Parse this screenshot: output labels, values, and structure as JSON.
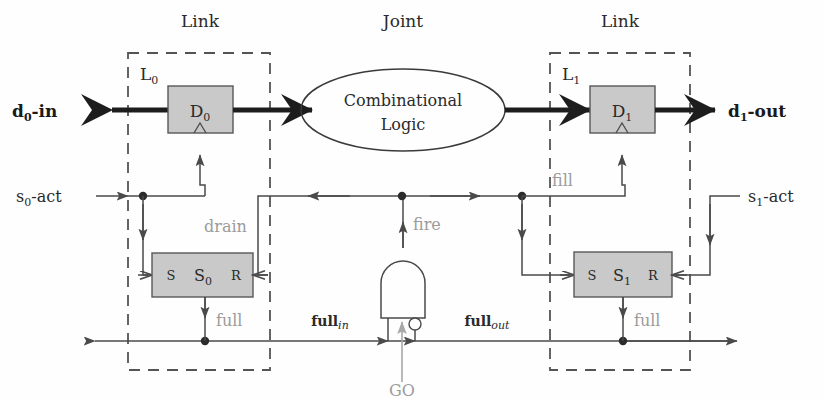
{
  "figure": {
    "type": "block-diagram"
  },
  "sections": {
    "link_left": "Link",
    "joint": "Joint",
    "link_right": "Link"
  },
  "link_left": {
    "name": "L",
    "name_sub": "0",
    "data_register": {
      "label": "D",
      "sub": "0"
    },
    "state_register": {
      "label": "S",
      "sub": "0",
      "set_pin": "S",
      "reset_pin": "R"
    },
    "full_label": "full"
  },
  "link_right": {
    "name": "L",
    "name_sub": "1",
    "data_register": {
      "label": "D",
      "sub": "1"
    },
    "state_register": {
      "label": "S",
      "sub": "1",
      "set_pin": "S",
      "reset_pin": "R"
    },
    "full_label": "full"
  },
  "joint": {
    "combinational_logic_line1": "Combinational",
    "combinational_logic_line2": "Logic",
    "gate_type": "and-gate-with-inverted-input",
    "output_label": "fire",
    "input_left_label": "full",
    "input_left_sub": "in",
    "input_right_label": "full",
    "input_right_sub": "out",
    "input_mid_label": "GO"
  },
  "signals": {
    "data_in": "d",
    "data_in_sub": "0",
    "data_in_suffix": "-in",
    "data_out": "d",
    "data_out_sub": "1",
    "data_out_suffix": "-out",
    "act_left": "s",
    "act_left_sub": "0",
    "act_left_suffix": "-act",
    "act_right": "s",
    "act_right_sub": "1",
    "act_right_suffix": "-act",
    "drain": "drain",
    "fill": "fill"
  },
  "colors": {
    "register_fill": "#c9c9c9",
    "register_stroke": "#585858",
    "wire": "#4a4a4a",
    "gray_annotation": "#9b9b9b",
    "data_bus": "#1d1d1d",
    "dashed_boundary": "#545454",
    "background": "#fefefe"
  }
}
